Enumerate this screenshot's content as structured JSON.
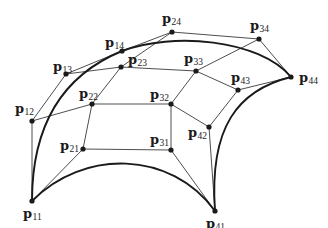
{
  "figure": {
    "colors": {
      "background": "#ffffff",
      "net_line": "#3a3a3a",
      "boundary_curve": "#1a1a1a",
      "point": "#1a1a1a",
      "label": "#1a1a1a"
    }
  },
  "control_points": [
    {
      "id": "p11",
      "base": "p",
      "sub": "11",
      "x": 32,
      "y": 201,
      "lx": 23,
      "ly": 218
    },
    {
      "id": "p12",
      "base": "p",
      "sub": "12",
      "x": 32,
      "y": 121,
      "lx": 15,
      "ly": 113
    },
    {
      "id": "p13",
      "base": "p",
      "sub": "13",
      "x": 66,
      "y": 74,
      "lx": 53,
      "ly": 71
    },
    {
      "id": "p14",
      "base": "p",
      "sub": "14",
      "x": 122,
      "y": 51,
      "lx": 105,
      "ly": 47
    },
    {
      "id": "p21",
      "base": "p",
      "sub": "21",
      "x": 83,
      "y": 149,
      "lx": 60,
      "ly": 150
    },
    {
      "id": "p22",
      "base": "p",
      "sub": "22",
      "x": 92,
      "y": 104,
      "lx": 79,
      "ly": 98
    },
    {
      "id": "p23",
      "base": "p",
      "sub": "23",
      "x": 121,
      "y": 67,
      "lx": 128,
      "ly": 64
    },
    {
      "id": "p24",
      "base": "p",
      "sub": "24",
      "x": 172,
      "y": 32,
      "lx": 162,
      "ly": 23
    },
    {
      "id": "p31",
      "base": "p",
      "sub": "31",
      "x": 171,
      "y": 150,
      "lx": 150,
      "ly": 144
    },
    {
      "id": "p32",
      "base": "p",
      "sub": "32",
      "x": 171,
      "y": 104,
      "lx": 150,
      "ly": 99
    },
    {
      "id": "p33",
      "base": "p",
      "sub": "33",
      "x": 196,
      "y": 71,
      "lx": 184,
      "ly": 63
    },
    {
      "id": "p34",
      "base": "p",
      "sub": "34",
      "x": 259,
      "y": 39,
      "lx": 250,
      "ly": 30
    },
    {
      "id": "p41",
      "base": "p",
      "sub": "41",
      "x": 215,
      "y": 211,
      "lx": 206,
      "ly": 228
    },
    {
      "id": "p42",
      "base": "p",
      "sub": "42",
      "x": 209,
      "y": 127,
      "lx": 188,
      "ly": 137
    },
    {
      "id": "p43",
      "base": "p",
      "sub": "43",
      "x": 238,
      "y": 90,
      "lx": 231,
      "ly": 82
    },
    {
      "id": "p44",
      "base": "p",
      "sub": "44",
      "x": 291,
      "y": 77,
      "lx": 299,
      "ly": 82
    }
  ],
  "net_polylines": [
    [
      "p11",
      "p12",
      "p13",
      "p14"
    ],
    [
      "p21",
      "p22",
      "p23",
      "p24"
    ],
    [
      "p31",
      "p32",
      "p33",
      "p34"
    ],
    [
      "p41",
      "p42",
      "p43",
      "p44"
    ],
    [
      "p11",
      "p21",
      "p31",
      "p41"
    ],
    [
      "p12",
      "p22",
      "p32",
      "p42"
    ],
    [
      "p13",
      "p23",
      "p33",
      "p43"
    ],
    [
      "p14",
      "p24",
      "p34",
      "p44"
    ]
  ],
  "boundary_curves": [
    {
      "name": "left-boundary-curve",
      "cp": [
        "p11",
        "p12",
        "p13",
        "p14"
      ]
    },
    {
      "name": "top-boundary-curve",
      "cp": [
        "p14",
        "p24",
        "p34",
        "p44"
      ]
    },
    {
      "name": "right-boundary-curve",
      "cp": [
        "p41",
        "p42",
        "p43",
        "p44"
      ]
    },
    {
      "name": "bottom-boundary-curve",
      "cp": [
        "p11",
        "p21",
        "p31",
        "p41"
      ]
    }
  ]
}
